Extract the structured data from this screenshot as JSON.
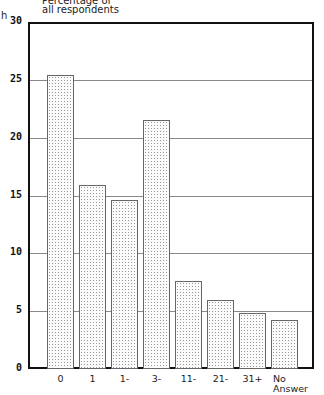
{
  "chart_data": {
    "type": "bar",
    "title": "",
    "ylabel": "Percentage of all respondents",
    "xlabel": "",
    "ylim": [
      0,
      30
    ],
    "yticks": [
      0,
      5,
      10,
      15,
      20,
      25,
      30
    ],
    "grid": true,
    "categories": [
      "0",
      "1",
      "1-",
      "3-",
      "11-",
      "21-",
      "31+",
      "No Answer"
    ],
    "values": [
      25.4,
      15.9,
      14.6,
      21.5,
      7.6,
      6.0,
      4.8,
      4.2
    ]
  },
  "labels": {
    "ylabel_line1": "Percentage of",
    "ylabel_line2": "all respondents",
    "left_fragment": "h"
  },
  "colors": {
    "frame": "#111111",
    "grid": "#888888",
    "bar_border": "#666666",
    "bar_dots": "#9a9a9a"
  }
}
